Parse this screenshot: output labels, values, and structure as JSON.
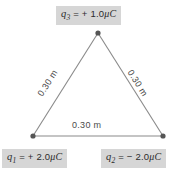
{
  "diagram": {
    "type": "equilateral-triangle-charge-configuration",
    "background_color": "#ffffff",
    "line_color": "#8a8a8a",
    "vertex_color": "#555555",
    "label_box_color": "#d6d6d6",
    "text_color": "#2b2b2b"
  },
  "charges": [
    {
      "id": "q3",
      "symbol": "q",
      "subscript": "3",
      "equals": "=",
      "sign": "+",
      "magnitude": "1.0",
      "unit": "μC",
      "full_label": "q3 = + 1.0μC",
      "position": "top-apex",
      "vertex_x": 98,
      "vertex_y": 33
    },
    {
      "id": "q1",
      "symbol": "q",
      "subscript": "1",
      "equals": "=",
      "sign": "+",
      "magnitude": "2.0",
      "unit": "μC",
      "full_label": "q1 = + 2.0μC",
      "position": "bottom-left",
      "vertex_x": 33,
      "vertex_y": 136
    },
    {
      "id": "q2",
      "symbol": "q",
      "subscript": "2",
      "equals": "=",
      "sign": "−",
      "magnitude": "2.0",
      "unit": "μC",
      "full_label": "q2 = − 2.0μC",
      "position": "bottom-right",
      "vertex_x": 163,
      "vertex_y": 136
    }
  ],
  "sides": [
    {
      "id": "side-left",
      "label": "0.30 m",
      "from": "q1",
      "to": "q3"
    },
    {
      "id": "side-right",
      "label": "0.30 m",
      "from": "q3",
      "to": "q2"
    },
    {
      "id": "side-bottom",
      "label": "0.30 m",
      "from": "q1",
      "to": "q2"
    }
  ]
}
